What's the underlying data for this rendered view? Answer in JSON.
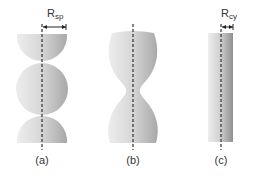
{
  "figure": {
    "panels": [
      {
        "id": "a",
        "label": "(a)",
        "shape": "stacked spheres (unduloid with spherical segments)",
        "radius_label": "R",
        "radius_sub": "sp"
      },
      {
        "id": "b",
        "label": "(b)",
        "shape": "necked unduloid"
      },
      {
        "id": "c",
        "label": "(c)",
        "shape": "cylinder",
        "radius_label": "R",
        "radius_sub": "cy"
      }
    ],
    "colors": {
      "fill_light": "#e8e8e8",
      "fill_dark": "#9a9a9a",
      "axis": "#333333"
    }
  }
}
